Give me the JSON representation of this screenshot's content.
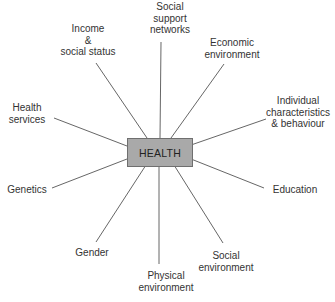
{
  "diagram": {
    "center": {
      "label": "HEALTH",
      "fill": "#a9a9a9",
      "border": "#6f6f6f"
    },
    "line_color": "#555555",
    "determinants": [
      {
        "id": "social-support",
        "lines": [
          "Social",
          "support",
          "networks"
        ]
      },
      {
        "id": "income",
        "lines": [
          "Income",
          "&",
          "social status"
        ]
      },
      {
        "id": "economic",
        "lines": [
          "Economic",
          "environment"
        ]
      },
      {
        "id": "individual",
        "lines": [
          "Individual",
          "characteristics",
          "& behaviour"
        ]
      },
      {
        "id": "health-services",
        "lines": [
          "Health",
          "services"
        ]
      },
      {
        "id": "genetics",
        "lines": [
          "Genetics"
        ]
      },
      {
        "id": "education",
        "lines": [
          "Education"
        ]
      },
      {
        "id": "gender",
        "lines": [
          "Gender"
        ]
      },
      {
        "id": "physical",
        "lines": [
          "Physical",
          "environment"
        ]
      },
      {
        "id": "social-env",
        "lines": [
          "Social",
          "environment"
        ]
      }
    ]
  }
}
